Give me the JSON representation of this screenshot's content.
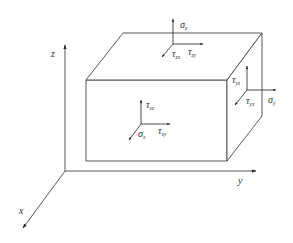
{
  "diagram": {
    "type": "stress-element-3d",
    "colors": {
      "line": "#444444",
      "text": "#333333",
      "background": "#ffffff"
    },
    "axes": {
      "x": "x",
      "y": "y",
      "z": "z"
    },
    "faces": {
      "top": {
        "normal_stress": {
          "sym": "σ",
          "sub": "z"
        },
        "shear_1": {
          "sym": "τ",
          "sub": "zx"
        },
        "shear_2": {
          "sym": "τ",
          "sub": "zy"
        }
      },
      "front": {
        "normal_stress": {
          "sym": "σ",
          "sub": "x"
        },
        "shear_1": {
          "sym": "τ",
          "sub": "xz"
        },
        "shear_2": {
          "sym": "τ",
          "sub": "xy"
        }
      },
      "right": {
        "normal_stress": {
          "sym": "σ",
          "sub": "y"
        },
        "shear_1": {
          "sym": "τ",
          "sub": "yz"
        },
        "shear_2": {
          "sym": "τ",
          "sub": "yx"
        }
      }
    }
  }
}
